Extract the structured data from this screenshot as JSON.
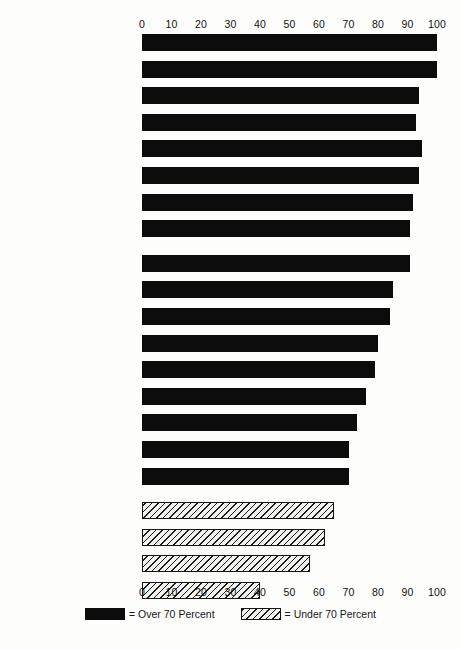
{
  "chart_data": {
    "type": "bar",
    "orientation": "horizontal",
    "title": "",
    "xlabel": "",
    "ylabel": "",
    "xlim": [
      0,
      100
    ],
    "grid": false,
    "legend_position": "bottom-center",
    "xticks": [
      "0",
      "10",
      "20",
      "30",
      "40",
      "50",
      "60",
      "70",
      "80",
      "90",
      "100"
    ],
    "xtick_values": [
      0,
      10,
      20,
      30,
      40,
      50,
      60,
      70,
      80,
      90,
      100
    ],
    "axis_top": true,
    "axis_bottom": true,
    "categories": [
      "Shaving—Women",
      "Skin Types",
      "Dry Cleaning",
      "Shopping",
      "Ironing",
      "Basic Hygiene",
      "Feminine Hygiene",
      "Shampooing",
      "Acne",
      "Dressing, Interview",
      "Caring for Clothes",
      "Basic Make-up",
      "Laundering",
      "Poise",
      "Setting Hair",
      "Combing Hair",
      "Manicure",
      "Exercise",
      "Advanced Make-up",
      "Shaving—Men",
      "Dieting"
    ],
    "values": [
      100,
      100,
      94,
      93,
      95,
      94,
      92,
      91,
      91,
      85,
      84,
      80,
      79,
      76,
      73,
      70,
      70,
      65,
      62,
      57,
      40
    ],
    "series": [
      {
        "name": "Over 70 Percent",
        "style": "solid",
        "color": "#0c0c0c",
        "values": [
          100,
          100,
          94,
          93,
          95,
          94,
          92,
          91,
          91,
          85,
          84,
          80,
          79,
          76,
          73,
          70,
          70,
          null,
          null,
          null,
          null
        ]
      },
      {
        "name": "Under 70 Percent",
        "style": "hatched",
        "color": "#f2f2f0",
        "values": [
          null,
          null,
          null,
          null,
          null,
          null,
          null,
          null,
          null,
          null,
          null,
          null,
          null,
          null,
          null,
          null,
          null,
          65,
          62,
          57,
          40
        ]
      }
    ],
    "bars": [
      {
        "label": "Shaving—Women",
        "value": 100,
        "style": "solid",
        "group": 1
      },
      {
        "label": "Skin Types",
        "value": 100,
        "style": "solid",
        "group": 1
      },
      {
        "label": "Dry Cleaning",
        "value": 94,
        "style": "solid",
        "group": 1
      },
      {
        "label": "Shopping",
        "value": 93,
        "style": "solid",
        "group": 1
      },
      {
        "label": "Ironing",
        "value": 95,
        "style": "solid",
        "group": 1
      },
      {
        "label": "Basic Hygiene",
        "value": 94,
        "style": "solid",
        "group": 1
      },
      {
        "label": "Feminine Hygiene",
        "value": 92,
        "style": "solid",
        "group": 1
      },
      {
        "label": "Shampooing",
        "value": 91,
        "style": "solid",
        "group": 1
      },
      {
        "label": "Acne",
        "value": 91,
        "style": "solid",
        "group": 2
      },
      {
        "label": "Dressing, Interview",
        "value": 85,
        "style": "solid",
        "group": 2
      },
      {
        "label": "Caring for Clothes",
        "value": 84,
        "style": "solid",
        "group": 2
      },
      {
        "label": "Basic Make-up",
        "value": 80,
        "style": "solid",
        "group": 2
      },
      {
        "label": "Laundering",
        "value": 79,
        "style": "solid",
        "group": 2
      },
      {
        "label": "Poise",
        "value": 76,
        "style": "solid",
        "group": 2
      },
      {
        "label": "Setting Hair",
        "value": 73,
        "style": "solid",
        "group": 2
      },
      {
        "label": "Combing Hair",
        "value": 70,
        "style": "solid",
        "group": 2
      },
      {
        "label": "Manicure",
        "value": 70,
        "style": "solid",
        "group": 2
      },
      {
        "label": "Exercise",
        "value": 65,
        "style": "hatched",
        "group": 3
      },
      {
        "label": "Advanced Make-up",
        "value": 62,
        "style": "hatched",
        "group": 3
      },
      {
        "label": "Shaving—Men",
        "value": 57,
        "style": "hatched",
        "group": 3
      },
      {
        "label": "Dieting",
        "value": 40,
        "style": "hatched",
        "group": 3
      }
    ],
    "legend": [
      {
        "label": "= Over 70 Percent",
        "style": "solid"
      },
      {
        "label": "= Under 70 Percent",
        "style": "hatched"
      }
    ]
  },
  "caption": ""
}
